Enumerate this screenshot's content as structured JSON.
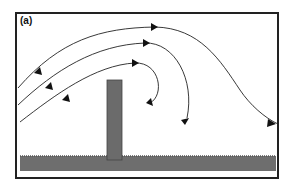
{
  "figure": {
    "panel_label": "(a)",
    "colors": {
      "barrier": "#6b6b6b",
      "ground": "#6e6e6e",
      "lines": "#222222",
      "frame": "#222222"
    }
  }
}
